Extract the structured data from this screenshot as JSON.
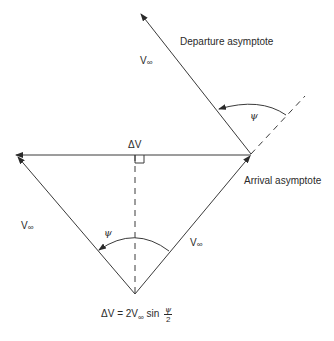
{
  "diagram": {
    "labels": {
      "departure_asymptote": "Departure asymptote",
      "arrival_asymptote": "Arrival asymptote",
      "delta_v": "ΔV",
      "v_inf_top": "V",
      "v_inf_left": "V",
      "v_inf_right": "V",
      "v_inf_sub": "∞",
      "psi_top": "ψ",
      "psi_bottom": "ψ"
    },
    "equation": {
      "lhs": "ΔV = 2V",
      "sub": "∞",
      "mid": " sin ",
      "frac_num": "ψ",
      "frac_den": "2"
    },
    "colors": {
      "line": "#3a3a3a",
      "text": "#2a2a2a"
    }
  }
}
